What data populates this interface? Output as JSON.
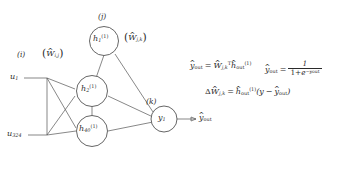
{
  "figure": {
    "type": "neural-network-diagram",
    "background": "#ffffff",
    "stroke_color": "#555555",
    "text_color": "#2b2b2b"
  },
  "layer_labels": {
    "input_index": "(i)",
    "hidden_index": "(j)",
    "output_index": "(k)"
  },
  "weight_labels": {
    "input_to_hidden": {
      "delta": "",
      "hat": "^",
      "symbol": "W",
      "sub": "i,j",
      "display": "(Ŵ_i,j)"
    },
    "hidden_to_output": {
      "hat": "^",
      "symbol": "W",
      "sub": "j,k",
      "display": "(Ŵ_j,k)"
    }
  },
  "inputs": [
    {
      "id": "u1",
      "symbol": "u",
      "sub": "1"
    },
    {
      "id": "u324",
      "symbol": "u",
      "sub": "324"
    }
  ],
  "hidden_nodes": [
    {
      "id": "h1",
      "symbol": "h",
      "sub": "1",
      "sup": "(1)"
    },
    {
      "id": "h2",
      "symbol": "h",
      "sub": "2",
      "sup": "(1)"
    },
    {
      "id": "h40",
      "symbol": "h",
      "sub": "40",
      "sup": "(1)"
    }
  ],
  "output_nodes": [
    {
      "id": "y1",
      "symbol": "y",
      "sub": "1"
    }
  ],
  "output_arrow_label": {
    "symbol": "y",
    "hat": "^",
    "sub": "out"
  },
  "equations": [
    {
      "id": "forward-linear",
      "lhs": "ŷ_out",
      "rhs": "Ŵ_j,k^T ĥ_out^(1)",
      "plain": "ŷ_out = Ŵ_{j,k}^T ĥ_out^{(1)}"
    },
    {
      "id": "sigmoid",
      "lhs": "ŷ_out",
      "rhs": "1 / (1 + e^{-ŷ_out})",
      "plain": "ŷ_out = 1 / (1 + e^{-ŷ_out})"
    },
    {
      "id": "weight-update",
      "lhs": "ΔŴ_j,k",
      "rhs": "ĥ_out^(1) (y - ŷ_out)",
      "plain": "ΔŴ_{j,k} = ĥ_out^{(1)}(y − ŷ_out)"
    }
  ],
  "symbols": {
    "hat": "^",
    "delta": "Δ",
    "minus": "−",
    "equals": "=",
    "transpose": "T",
    "one": "1",
    "e": "e",
    "plus": "+",
    "lparen": "(",
    "rparen": ")",
    "y": "y",
    "out": "out"
  }
}
